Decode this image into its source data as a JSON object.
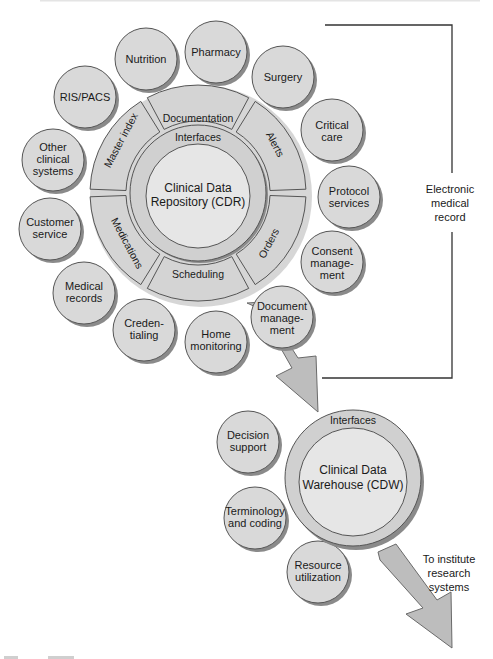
{
  "diagram": {
    "colors": {
      "bubble_fill": "#d9d9d9",
      "bubble_stroke": "#555555",
      "shadow": "#8a8a8a",
      "segment_fill": "#d4d4d4",
      "ring_fill": "#d0d0d0",
      "core_fill": "#e6e6e6",
      "arrow_fill": "#bdbdbd",
      "line": "#333333"
    },
    "cdr": {
      "title_line1": "Clinical Data",
      "title_line2": "Repository (CDR)",
      "ring_label": "Interfaces",
      "segments": [
        {
          "label": "Documentation"
        },
        {
          "label": "Alerts"
        },
        {
          "label": "Orders"
        },
        {
          "label": "Scheduling"
        },
        {
          "label": "Medications"
        },
        {
          "label": "Master index"
        }
      ]
    },
    "cdr_bubbles": [
      {
        "lines": [
          "Nutrition"
        ]
      },
      {
        "lines": [
          "Pharmacy"
        ]
      },
      {
        "lines": [
          "Surgery"
        ]
      },
      {
        "lines": [
          "Critical",
          "care"
        ]
      },
      {
        "lines": [
          "Protocol",
          "services"
        ]
      },
      {
        "lines": [
          "Consent",
          "manage-",
          "ment"
        ]
      },
      {
        "lines": [
          "Document",
          "manage-",
          "ment"
        ]
      },
      {
        "lines": [
          "Home",
          "monitoring"
        ]
      },
      {
        "lines": [
          "Creden-",
          "tialing"
        ]
      },
      {
        "lines": [
          "Medical",
          "records"
        ]
      },
      {
        "lines": [
          "Customer",
          "service"
        ]
      },
      {
        "lines": [
          "Other",
          "clinical",
          "systems"
        ]
      },
      {
        "lines": [
          "RIS/PACS"
        ]
      }
    ],
    "bracket_label": {
      "lines": [
        "Electronic",
        "medical",
        "record"
      ]
    },
    "cdw": {
      "title_line1": "Clinical Data",
      "title_line2": "Warehouse (CDW)",
      "ring_label": "Interfaces"
    },
    "cdw_bubbles": [
      {
        "lines": [
          "Decision",
          "support"
        ]
      },
      {
        "lines": [
          "Terminology",
          "and coding"
        ]
      },
      {
        "lines": [
          "Resource",
          "utilization"
        ]
      }
    ],
    "research_label": {
      "lines": [
        "To institute",
        "research",
        "systems"
      ]
    }
  }
}
